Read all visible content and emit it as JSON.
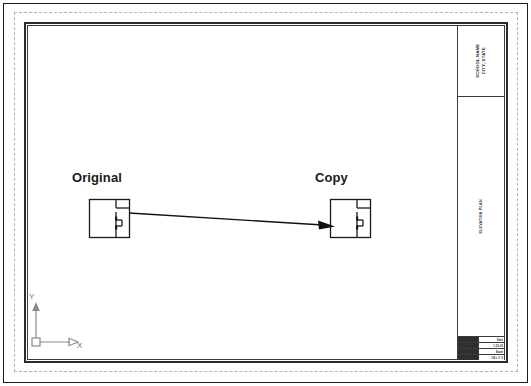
{
  "document": {
    "type": "cad-drawing-sheet",
    "background_color": "#ffffff",
    "line_color": "#1a1a1a"
  },
  "drawing": {
    "labels": {
      "original": "Original",
      "copy": "Copy"
    },
    "annotation_arrow": {
      "name": "copy-direction-arrow",
      "from": "Original",
      "to": "Copy"
    },
    "plans": [
      {
        "name": "floor-plan-original",
        "label": "Original"
      },
      {
        "name": "floor-plan-copy",
        "label": "Copy"
      }
    ]
  },
  "ucs_icon": {
    "x_axis_label": "X",
    "y_axis_label": "Y",
    "color": "#8a8a8a"
  },
  "title_block": {
    "top_cell_text": "SCHOOL NAME\nCITY, STATE",
    "middle_cell_text": "ELEVATION PLAN",
    "info_table": [
      {
        "key": "",
        "value": "Date"
      },
      {
        "key": "",
        "value": "1-22-03"
      },
      {
        "key": "",
        "value": "Scale"
      },
      {
        "key": "",
        "value": "1/4 = 1'-0"
      }
    ]
  }
}
